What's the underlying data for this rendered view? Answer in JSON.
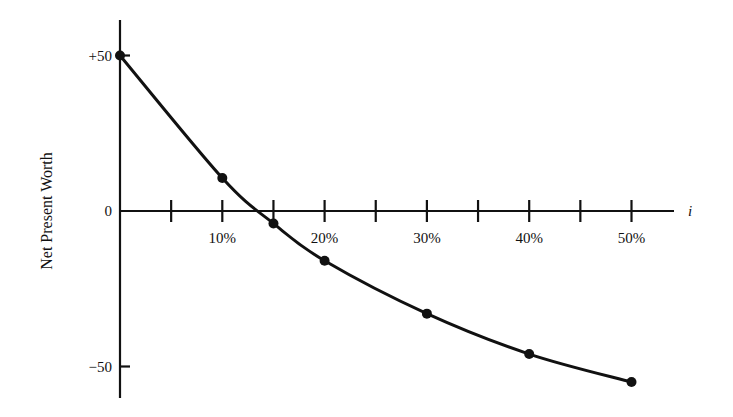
{
  "chart_data": {
    "type": "line",
    "title": "",
    "xlabel": "i",
    "ylabel": "Net Present Worth",
    "x_tick_labels": [
      "10%",
      "20%",
      "30%",
      "40%",
      "50%"
    ],
    "x_ticks_minor": [
      5,
      10,
      15,
      20,
      25,
      30,
      35,
      40,
      45,
      50
    ],
    "y_tick_labels": [
      "+50",
      "0",
      "−50"
    ],
    "y_ticks": [
      50,
      0,
      -50
    ],
    "xlim": [
      0,
      55
    ],
    "ylim": [
      -60,
      63
    ],
    "grid": false,
    "legend": null,
    "series": [
      {
        "name": "Net Present Worth",
        "x": [
          0,
          10,
          15,
          20,
          30,
          40,
          50
        ],
        "values": [
          50,
          10.6,
          -4,
          -16,
          -33,
          -46,
          -55
        ]
      }
    ]
  }
}
